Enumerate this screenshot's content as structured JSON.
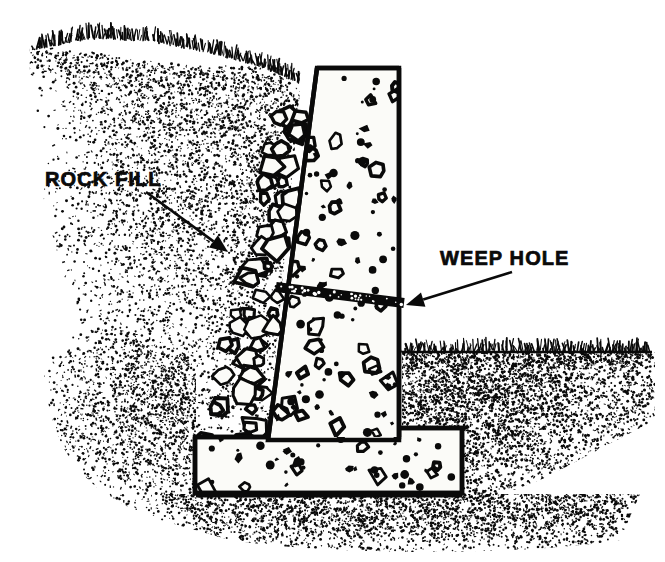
{
  "figure": {
    "background_color": "#ffffff",
    "ink_color": "#0a0a0a",
    "concrete_fill_color": "#fbfbf8",
    "width": 665,
    "height": 562
  },
  "labels": [
    {
      "id": "rock-fill",
      "text": "ROCK FILL",
      "x": 45,
      "y": 186,
      "leader_from": [
        146,
        192
      ],
      "leader_to": [
        228,
        252
      ]
    },
    {
      "id": "weep-hole",
      "text": "WEEP HOLE",
      "x": 440,
      "y": 265,
      "leader_from": [
        512,
        272
      ],
      "leader_to": [
        406,
        305
      ]
    }
  ],
  "structure": {
    "wall": {
      "name": "concrete retaining wall",
      "stem_top_y": 68,
      "stem_top_left_x": 317,
      "stem_top_right_x": 399,
      "stem_bottom_left_x": 268,
      "front_face_x": 399,
      "footing_top_y": 437,
      "footing_bottom_y": 493,
      "footing_left_x": 195,
      "footing_right_x": 462,
      "footing_step_right_y": 428
    },
    "weep_hole": {
      "name": "weep hole drain pipe",
      "start": [
        278,
        288
      ],
      "end": [
        404,
        304
      ],
      "thickness": 9
    },
    "rock_fill": {
      "name": "rock fill drainage zone",
      "count": 64,
      "top_y": 120,
      "bottom_y": 470
    },
    "ground": {
      "right_ground_line_y": 350,
      "right_ground_line_x_start": 404,
      "right_ground_line_x_end": 650,
      "left_slope_crest_y": 40,
      "footing_base_line_y": 495
    }
  },
  "textures": {
    "soil_stipple": "random dot stipple",
    "grass_tufts": "short vertical hatch marks",
    "concrete_aggregate": "scattered angular voids"
  }
}
